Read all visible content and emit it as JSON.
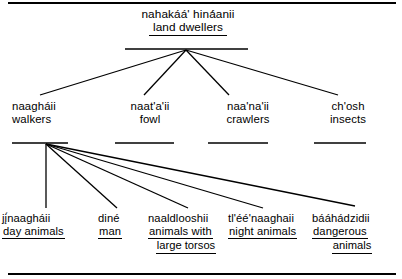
{
  "diagram": {
    "type": "tree",
    "frame": {
      "top_rule": true,
      "bottom_rule": true,
      "color": "#000000"
    },
    "root": {
      "term": "nahakáá'  hiná́anii",
      "gloss": "land  dwellers"
    },
    "level2": [
      {
        "term": "naagháii",
        "gloss": "walkers"
      },
      {
        "term": "naat'a'ii",
        "gloss": "fowl"
      },
      {
        "term": "naa'na'ii",
        "gloss": "crawlers"
      },
      {
        "term": "ch'osh",
        "gloss": "insects"
      }
    ],
    "level3": [
      {
        "term": "jį́naagháii",
        "gloss": "day animals",
        "gloss2": ""
      },
      {
        "term": "diné",
        "gloss": "man",
        "gloss2": ""
      },
      {
        "term": "naaldlooshii",
        "gloss": "animals with",
        "gloss2": "large  torsos"
      },
      {
        "term": "tl'éé'naaghaii",
        "gloss": "night animals",
        "gloss2": ""
      },
      {
        "term": "bááhádzidii",
        "gloss": "dangerous",
        "gloss2": "animals"
      }
    ]
  }
}
